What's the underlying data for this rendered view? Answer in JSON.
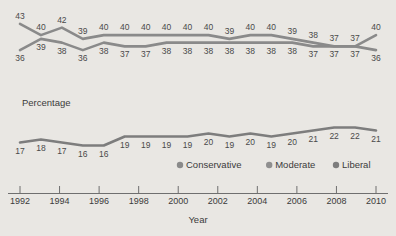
{
  "chart_data": {
    "type": "line",
    "title": "",
    "xlabel": "Year",
    "ylabel": "Percentage",
    "grid": false,
    "legend_position": "bottom",
    "x": [
      1992,
      1993,
      1994,
      1995,
      1996,
      1997,
      1998,
      1999,
      2000,
      2001,
      2002,
      2003,
      2004,
      2005,
      2006,
      2007,
      2008,
      2009
    ],
    "xtick_labels": [
      "1992",
      "1994",
      "1996",
      "1998",
      "2000",
      "2002",
      "2004",
      "2006",
      "2008",
      "2010"
    ],
    "xlim": [
      1992,
      2010
    ],
    "ylim": [
      15,
      44
    ],
    "series": [
      {
        "name": "Conservative",
        "color": "#8a8a8a",
        "values": [
          43,
          40,
          42,
          39,
          40,
          40,
          40,
          40,
          40,
          40,
          39,
          40,
          40,
          39,
          38,
          37,
          37,
          40
        ]
      },
      {
        "name": "Moderate",
        "color": "#8a8a8a",
        "values": [
          36,
          39,
          38,
          36,
          38,
          37,
          37,
          38,
          38,
          38,
          38,
          38,
          38,
          38,
          37,
          37,
          37,
          36
        ]
      },
      {
        "name": "Liberal",
        "color": "#7d7d7d",
        "values": [
          17,
          18,
          17,
          16,
          16,
          19,
          19,
          19,
          19,
          20,
          19,
          20,
          19,
          20,
          21,
          22,
          22,
          21
        ]
      }
    ]
  },
  "legend": {
    "items": [
      {
        "label": "Conservative",
        "marker_color": "#8a8a8a"
      },
      {
        "label": "Moderate",
        "marker_color": "#8f8f8f"
      },
      {
        "label": "Liberal",
        "marker_color": "#7d7d7d"
      }
    ]
  },
  "axis": {
    "y_axis_title": "Percentage",
    "x_axis_title": "Year"
  },
  "colors": {
    "background": "#e9e7e3",
    "text": "#3b3b3b",
    "axis": "#6f6f6f",
    "line": "#8a8a8a"
  }
}
